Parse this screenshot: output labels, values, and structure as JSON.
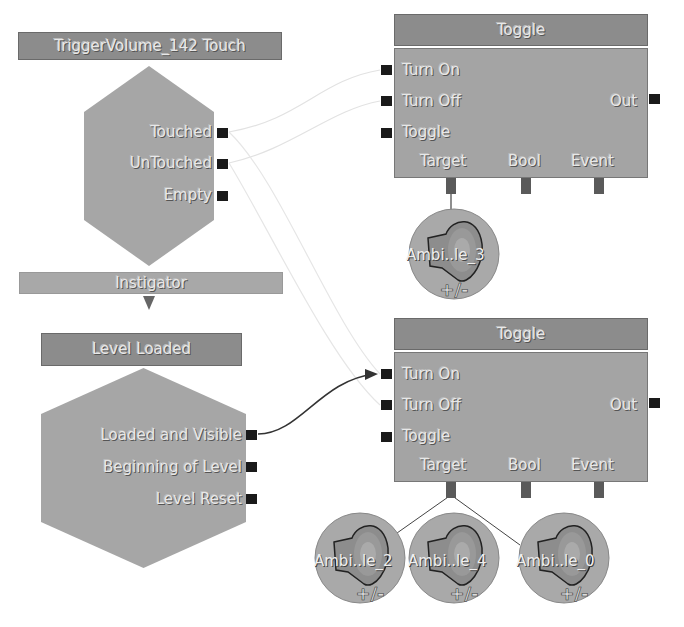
{
  "nodes": {
    "trigger_event": {
      "title": "TriggerVolume_142 Touch",
      "outputs": [
        "Touched",
        "UnTouched",
        "Empty"
      ],
      "variable_link": "Instigator"
    },
    "level_loaded_event": {
      "title": "Level Loaded",
      "outputs": [
        "Loaded and Visible",
        "Beginning of Level",
        "Level Reset"
      ]
    },
    "toggle_top": {
      "title": "Toggle",
      "inputs": [
        "Turn On",
        "Turn Off",
        "Toggle"
      ],
      "output": "Out",
      "variable_links": [
        "Target",
        "Bool",
        "Event"
      ]
    },
    "toggle_bottom": {
      "title": "Toggle",
      "inputs": [
        "Turn On",
        "Turn Off",
        "Toggle"
      ],
      "output": "Out",
      "variable_links": [
        "Target",
        "Bool",
        "Event"
      ]
    }
  },
  "variables": [
    {
      "label": "Ambi..le_3",
      "icon": "speaker-icon",
      "badge": "+/-"
    },
    {
      "label": "Ambi..le_2",
      "icon": "speaker-icon",
      "badge": "+/-"
    },
    {
      "label": "Ambi..le_4",
      "icon": "speaker-icon",
      "badge": "+/-"
    },
    {
      "label": "Ambi..le_0",
      "icon": "speaker-icon",
      "badge": "+/-"
    }
  ],
  "colors": {
    "node_body": "#a6a6a6",
    "node_title": "#8c8c8c",
    "port": "#1a1a1a",
    "var_port": "#5a5a5a",
    "active_wire": "#333333",
    "faint_wire": "#e0e0e0"
  }
}
